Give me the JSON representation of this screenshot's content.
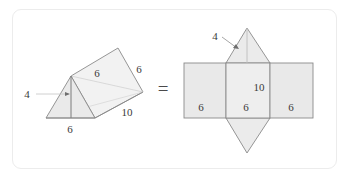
{
  "figure": {
    "equals_symbol": "=",
    "colors": {
      "frame_border": "#ececec",
      "stroke": "#808080",
      "hidden_stroke": "#c9c9c9",
      "fill": "#e9e9e9",
      "fill_light": "#f1f1f1",
      "label_text": "#3a3a3a",
      "background": "#ffffff"
    }
  },
  "prism": {
    "name": "triangular-prism",
    "labels": {
      "height": "4",
      "slant": "6",
      "side_edge": "6",
      "base": "6",
      "length": "10"
    }
  },
  "net": {
    "name": "prism-net",
    "labels": {
      "triangle_height": "4",
      "rectangle_height": "10",
      "left_width": "6",
      "middle_width": "6",
      "right_width": "6"
    }
  }
}
